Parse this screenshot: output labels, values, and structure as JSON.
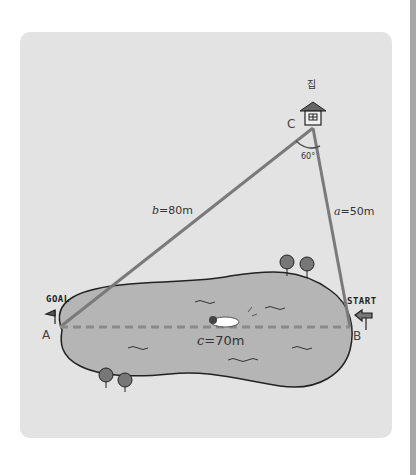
{
  "figure": {
    "house_label": "집",
    "vertices": {
      "A": "A",
      "B": "B",
      "C": "C"
    },
    "angle_label": "60°",
    "sides": {
      "a": {
        "var": "a",
        "text": "=50m"
      },
      "b": {
        "var": "b",
        "text": "=80m"
      },
      "c": {
        "var": "c",
        "text": "=70m"
      }
    },
    "signs": {
      "goal": "GOAL",
      "start": "START"
    },
    "colors": {
      "panel": "#e3e3e3",
      "lake": "#b5b5b5",
      "triangle": "#7a7a7a",
      "dash": "#8a8a8a",
      "house_roof": "#666666"
    }
  }
}
